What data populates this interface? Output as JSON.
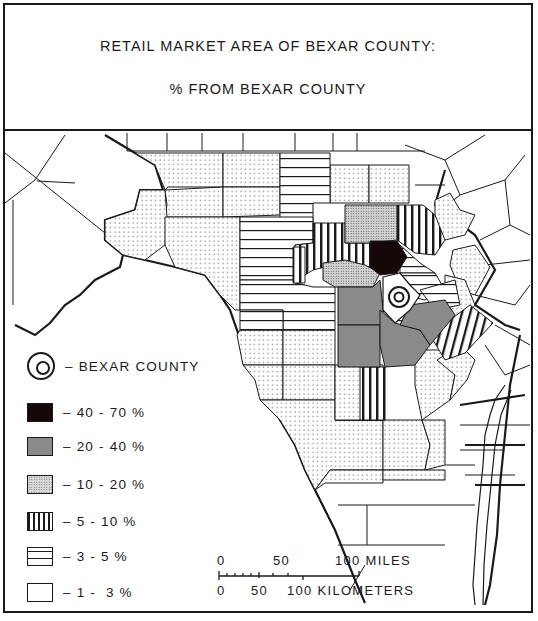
{
  "title": {
    "line1": "RETAIL MARKET AREA OF BEXAR COUNTY:",
    "line2": "% FROM BEXAR COUNTY"
  },
  "legend": {
    "items": [
      {
        "symbol": "bexar-county-symbol",
        "label": "– BEXAR COUNTY"
      },
      {
        "symbol": "solid-black",
        "label": "– 40 - 70 %",
        "color": "#140808"
      },
      {
        "symbol": "solid-gray",
        "label": "– 20 - 40 %",
        "color": "#8a8a8a"
      },
      {
        "symbol": "dense-stipple",
        "label": "– 10 - 20 %"
      },
      {
        "symbol": "vertical-lines",
        "label": "– 5 - 10 %"
      },
      {
        "symbol": "horizontal-lines",
        "label": "– 3 - 5 %"
      },
      {
        "symbol": "sparse-dots",
        "label": "– 1 -  3 %"
      }
    ]
  },
  "scale_bar": {
    "miles_labels": [
      "0",
      "50",
      "100 MILES"
    ],
    "km_labels": [
      "0",
      "50",
      "100 KILOMETERS"
    ]
  },
  "map": {
    "region": "South-Central Texas counties",
    "center_county": "Bexar County",
    "categories": [
      {
        "range": "40 - 70 %",
        "pattern": "solid-black",
        "count": 1
      },
      {
        "range": "20 - 40 %",
        "pattern": "solid-gray",
        "count": 5
      },
      {
        "range": "10 - 20 %",
        "pattern": "dense-stipple",
        "count": 2
      },
      {
        "range": "5 - 10 %",
        "pattern": "vertical-lines",
        "count": 5
      },
      {
        "range": "3 - 5 %",
        "pattern": "horizontal-lines",
        "count": 9
      },
      {
        "range": "1 - 3 %",
        "pattern": "sparse-dots",
        "count": 24
      }
    ]
  }
}
